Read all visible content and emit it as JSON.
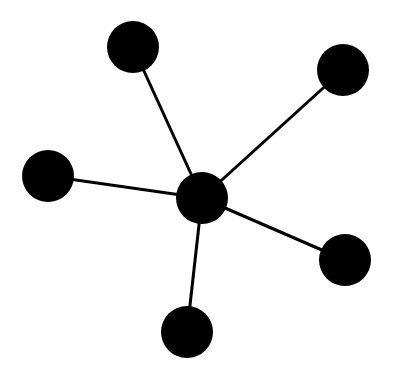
{
  "diagram": {
    "type": "star-graph",
    "background": "#ffffff",
    "node_color": "#000000",
    "edge_color": "#000000",
    "edge_width": 3,
    "nodes": [
      {
        "id": "center",
        "x": 202,
        "y": 198,
        "r": 26
      },
      {
        "id": "top-left",
        "x": 133,
        "y": 47,
        "r": 26
      },
      {
        "id": "top-right",
        "x": 343,
        "y": 70,
        "r": 26
      },
      {
        "id": "left",
        "x": 48,
        "y": 176,
        "r": 26
      },
      {
        "id": "bottom-right",
        "x": 345,
        "y": 260,
        "r": 26
      },
      {
        "id": "bottom",
        "x": 187,
        "y": 332,
        "r": 26
      }
    ],
    "edges": [
      {
        "from": "center",
        "to": "top-left"
      },
      {
        "from": "center",
        "to": "top-right"
      },
      {
        "from": "center",
        "to": "left"
      },
      {
        "from": "center",
        "to": "bottom-right"
      },
      {
        "from": "center",
        "to": "bottom"
      }
    ]
  }
}
